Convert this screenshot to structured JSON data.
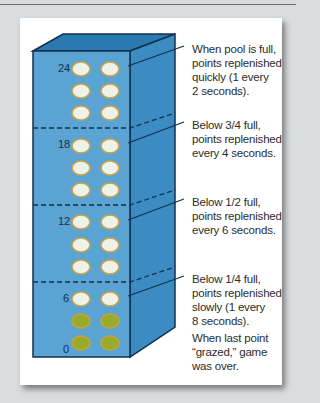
{
  "colors": {
    "front_face": "#5aa3d2",
    "top_face": "#2a79b0",
    "right_face": "#3c8cc3",
    "outline": "#10324f",
    "point_full": "#eef3ea",
    "point_full_rim": "#c9a24a",
    "point_grazed": "#9aab2c",
    "point_grazed_rim": "#c3a53a"
  },
  "scale_labels": [
    "24",
    "18",
    "12",
    "6",
    "0"
  ],
  "callouts": [
    {
      "id": "full",
      "lines": [
        "When pool is full,",
        "points replenished",
        "quickly (1 every",
        "2 seconds)."
      ]
    },
    {
      "id": "three-quarter",
      "lines": [
        "Below 3/4 full,",
        "points replenished",
        "every 4 seconds."
      ]
    },
    {
      "id": "half",
      "lines": [
        "Below 1/2 full,",
        "points replenished",
        "every 6 seconds."
      ]
    },
    {
      "id": "quarter",
      "lines": [
        "Below 1/4 full,",
        "points replenished",
        "slowly (1 every",
        "8 seconds)."
      ]
    },
    {
      "id": "game-over",
      "lines": [
        "When last point",
        "“grazed,” game",
        "was over."
      ]
    }
  ],
  "pool": {
    "rows": 10,
    "columns": 2,
    "grazed_rows": 2,
    "zones": [
      "full",
      "below-3/4",
      "below-1/2",
      "below-1/4"
    ]
  }
}
